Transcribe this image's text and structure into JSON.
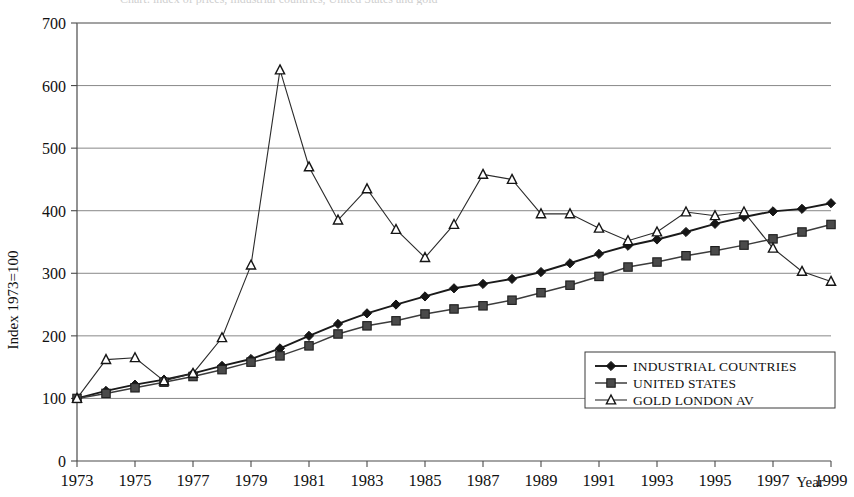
{
  "figure": {
    "title_clipped": "Chart: index of prices, industrial countries, United States and gold",
    "year_axis_label": "Year"
  },
  "chart_data": {
    "type": "line",
    "title": "",
    "xlabel": "Year",
    "ylabel": "Index  1973=100",
    "xlim": [
      1973,
      1999
    ],
    "ylim": [
      0,
      700
    ],
    "ytick_step": 100,
    "xtick_step": 2,
    "grid": true,
    "legend_position": "bottom-right",
    "yticks": [
      0,
      100,
      200,
      300,
      400,
      500,
      600,
      700
    ],
    "ytick_labels": [
      "0",
      "100",
      "200",
      "300",
      "400",
      "500",
      "600",
      "700"
    ],
    "xticks": [
      1973,
      1975,
      1977,
      1979,
      1981,
      1983,
      1985,
      1987,
      1989,
      1991,
      1993,
      1995,
      1997,
      1999
    ],
    "xtick_labels": [
      "1973",
      "1975",
      "1977",
      "1979",
      "1981",
      "1983",
      "1985",
      "1987",
      "1989",
      "1991",
      "1993",
      "1995",
      "1997",
      "1999"
    ],
    "x": [
      1973,
      1974,
      1975,
      1976,
      1977,
      1978,
      1979,
      1980,
      1981,
      1982,
      1983,
      1984,
      1985,
      1986,
      1987,
      1988,
      1989,
      1990,
      1991,
      1992,
      1993,
      1994,
      1995,
      1996,
      1997,
      1998,
      1999
    ],
    "series": [
      {
        "name": "INDUSTRIAL COUNTRIES",
        "marker": "diamond",
        "color": "#151515",
        "values": [
          100,
          112,
          122,
          130,
          140,
          152,
          163,
          180,
          200,
          219,
          236,
          250,
          263,
          276,
          283,
          291,
          302,
          316,
          331,
          344,
          354,
          366,
          379,
          390,
          399,
          403,
          412
        ]
      },
      {
        "name": "UNITED STATES",
        "marker": "square",
        "color": "#4a4a4a",
        "values": [
          100,
          108,
          117,
          126,
          135,
          146,
          158,
          168,
          184,
          203,
          216,
          224,
          235,
          243,
          248,
          257,
          269,
          281,
          295,
          310,
          318,
          328,
          336,
          345,
          355,
          366,
          378
        ]
      },
      {
        "name": "GOLD LONDON AV",
        "marker": "triangle",
        "color": "#151515",
        "values": [
          100,
          162,
          165,
          128,
          140,
          197,
          313,
          625,
          470,
          385,
          435,
          370,
          325,
          378,
          458,
          450,
          395,
          395,
          372,
          352,
          366,
          398,
          392,
          398,
          340,
          303,
          287
        ]
      }
    ],
    "annotations": []
  },
  "legend": {
    "entries": [
      {
        "label": "INDUSTRIAL COUNTRIES",
        "marker": "diamond"
      },
      {
        "label": "UNITED STATES",
        "marker": "square"
      },
      {
        "label": "GOLD LONDON AV",
        "marker": "triangle"
      }
    ]
  }
}
